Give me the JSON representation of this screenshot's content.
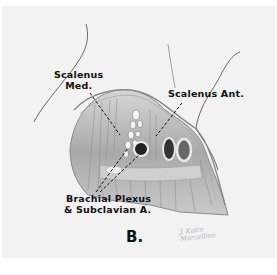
{
  "figure": {
    "panel_letter": "B.",
    "labels": {
      "scalenus_med_line1": "Scalenus",
      "scalenus_med_line2": "Med.",
      "scalenus_ant": "Scalenus Ant.",
      "brachial_line1": "Brachial Plexus",
      "brachial_line2": "& Subclavian A."
    },
    "signature_line1": "J. Katin",
    "signature_line2": "Marcellino",
    "colors": {
      "background": "#ffffff",
      "card": "#f2f2f2",
      "ink": "#111111",
      "tissue": "#b8b8b8"
    }
  }
}
